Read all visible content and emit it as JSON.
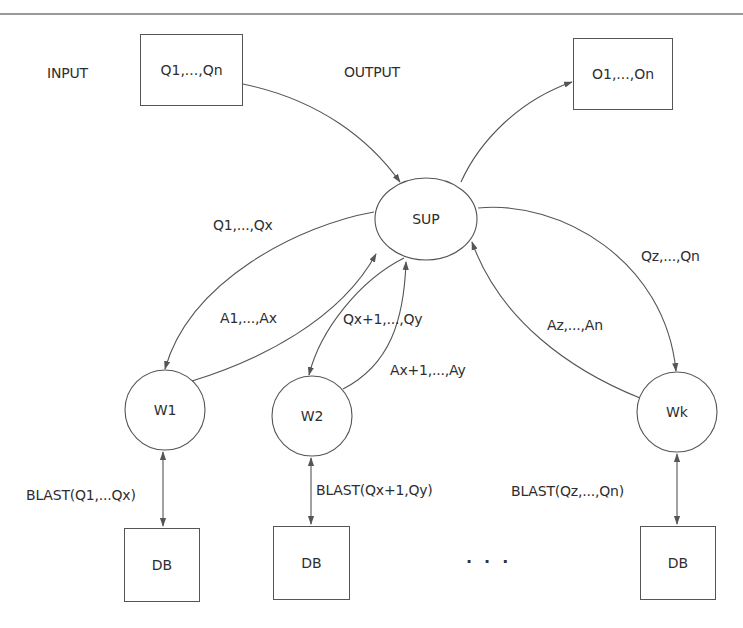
{
  "diagram": {
    "input": {
      "label": "INPUT",
      "content": "Q1,...,Qn"
    },
    "output": {
      "label": "OUTPUT",
      "content": "O1,...,On"
    },
    "supervisor": {
      "label": "SUP"
    },
    "workers": [
      {
        "label": "W1",
        "query_edge_label": "Q1,...,Qx",
        "answer_edge_label": "A1,...,Ax",
        "blast_label": "BLAST(Q1,...Qx)",
        "db_label": "DB"
      },
      {
        "label": "W2",
        "query_edge_label": "Qx+1,...,Qy",
        "answer_edge_label": "Ax+1,...,Ay",
        "blast_label": "BLAST(Qx+1,Qy)",
        "db_label": "DB"
      },
      {
        "label": "Wk",
        "query_edge_label": "Qz,...,Qn",
        "answer_edge_label": "Az,...,An",
        "blast_label": "BLAST(Qz,...,Qn)",
        "db_label": "DB"
      }
    ],
    "ellipsis": "..."
  },
  "colors": {
    "stroke": "#555555",
    "text": "#2e2e2e",
    "rule": "#9a9a9a"
  }
}
